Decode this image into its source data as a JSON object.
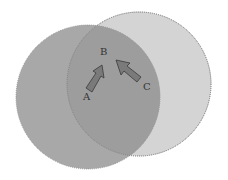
{
  "diagram": {
    "labels": {
      "a": "A",
      "b": "B",
      "c": "C"
    },
    "colors": {
      "left_circle": "#a6a6a6",
      "right_circle": "#d3d3d3",
      "overlap": "#9c9c9c",
      "arrow_fill": "#7a7a7a",
      "arrow_stroke": "#3a3a3a",
      "outline": "#777777"
    }
  }
}
